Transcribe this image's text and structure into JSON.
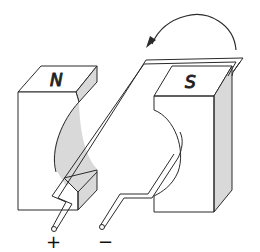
{
  "diagram": {
    "type": "dc-motor-schematic",
    "magnets": [
      {
        "pole": "N",
        "side": "left"
      },
      {
        "pole": "S",
        "side": "right"
      }
    ],
    "terminals": [
      {
        "label": "+",
        "side": "left"
      },
      {
        "label": "−",
        "side": "right"
      }
    ],
    "rotation_arrow": "counterclockwise",
    "colors": {
      "line": "#2a2a2a",
      "face": "#ffffff",
      "shade": "#d9d9d9"
    }
  }
}
